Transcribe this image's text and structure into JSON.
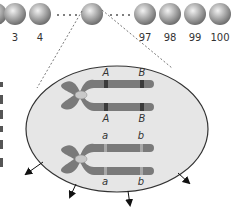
{
  "figure": {
    "population": {
      "cells": [
        {
          "label": "",
          "cx": 0
        },
        {
          "label": "3",
          "cx": 15
        },
        {
          "label": "4",
          "cx": 40
        },
        {
          "label": "",
          "cx": 91,
          "selected": true
        },
        {
          "label": "97",
          "cx": 145
        },
        {
          "label": "98",
          "cx": 170
        },
        {
          "label": "99",
          "cx": 195
        },
        {
          "label": "100",
          "cx": 220
        }
      ],
      "ellipsis": "· · · ·"
    },
    "enlarged_cell": {
      "chromosome_pairs": [
        {
          "top_alleles": [
            "A",
            "B"
          ],
          "bottom_alleles": [
            "A",
            "B"
          ],
          "band_color": "#3a3a3a"
        },
        {
          "top_alleles": [
            "a",
            "b"
          ],
          "bottom_alleles": [
            "a",
            "b"
          ],
          "band_color": "#a8a8a8"
        }
      ]
    },
    "colors": {
      "cell_fill": "#e6e6e6",
      "cell_stroke": "#333333",
      "chromosome": "#7a7a7a",
      "centromere": "#c8c8c8",
      "sphere_light": "#e8e8e8",
      "sphere_dark": "#7d7d7d"
    }
  }
}
